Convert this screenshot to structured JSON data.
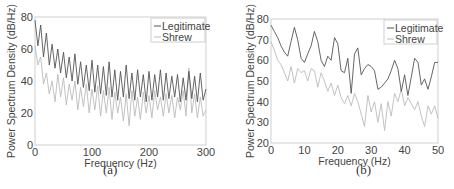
{
  "chart_data": [
    {
      "type": "line",
      "caption": "(a)",
      "title": "",
      "xlabel": "Frequency (Hz)",
      "ylabel": "Power Spectrum Density (dB/Hz)",
      "xlim": [
        0,
        300
      ],
      "ylim": [
        0,
        80
      ],
      "xticks": [
        0,
        100,
        200,
        300
      ],
      "yticks": [
        0,
        20,
        40,
        60,
        80
      ],
      "grid": false,
      "legend_position": "top-right",
      "x": [
        0,
        5,
        10,
        15,
        20,
        25,
        30,
        35,
        40,
        45,
        50,
        55,
        60,
        65,
        70,
        75,
        80,
        85,
        90,
        95,
        100,
        105,
        110,
        115,
        120,
        125,
        130,
        135,
        140,
        145,
        150,
        155,
        160,
        165,
        170,
        175,
        180,
        185,
        190,
        195,
        200,
        205,
        210,
        215,
        220,
        225,
        230,
        235,
        240,
        245,
        250,
        255,
        260,
        265,
        270,
        275,
        280,
        285,
        290,
        295,
        300
      ],
      "series": [
        {
          "name": "Legitimate",
          "color": "#555555",
          "values": [
            78,
            62,
            75,
            55,
            70,
            50,
            63,
            48,
            60,
            45,
            58,
            42,
            55,
            40,
            57,
            38,
            52,
            36,
            50,
            34,
            53,
            33,
            50,
            32,
            49,
            31,
            52,
            30,
            47,
            28,
            46,
            30,
            50,
            29,
            45,
            28,
            47,
            30,
            44,
            27,
            46,
            28,
            44,
            30,
            47,
            28,
            45,
            29,
            43,
            30,
            44,
            27,
            42,
            28,
            46,
            29,
            43,
            27,
            45,
            28,
            35
          ]
        },
        {
          "name": "Shrew",
          "color": "#bbbbbb",
          "values": [
            62,
            50,
            55,
            38,
            45,
            32,
            40,
            27,
            44,
            30,
            42,
            25,
            38,
            28,
            40,
            22,
            36,
            24,
            38,
            20,
            35,
            22,
            37,
            18,
            34,
            20,
            36,
            16,
            33,
            20,
            30,
            15,
            32,
            12,
            34,
            18,
            30,
            16,
            33,
            20,
            31,
            17,
            34,
            22,
            30,
            18,
            32,
            20,
            31,
            17,
            30,
            22,
            34,
            18,
            48,
            20,
            32,
            17,
            30,
            18,
            22
          ]
        }
      ]
    },
    {
      "type": "line",
      "caption": "(b)",
      "title": "",
      "xlabel": "Frequency (Hz)",
      "ylabel": "Power Spectrum Density (dB/Hz)",
      "xlim": [
        0,
        50
      ],
      "ylim": [
        20,
        80
      ],
      "xticks": [
        0,
        10,
        20,
        30,
        40,
        50
      ],
      "yticks": [
        20,
        30,
        40,
        50,
        60,
        70,
        80
      ],
      "grid": false,
      "legend_position": "top-right",
      "x": [
        0,
        1,
        2,
        3,
        4,
        5,
        6,
        7,
        8,
        9,
        10,
        11,
        12,
        13,
        14,
        15,
        16,
        17,
        18,
        19,
        20,
        21,
        22,
        23,
        24,
        25,
        26,
        27,
        28,
        29,
        30,
        31,
        32,
        33,
        34,
        35,
        36,
        37,
        38,
        39,
        40,
        41,
        42,
        43,
        44,
        45,
        46,
        47,
        48,
        49,
        50
      ],
      "series": [
        {
          "name": "Legitimate",
          "color": "#555555",
          "values": [
            77,
            74,
            71,
            67,
            64,
            62,
            69,
            76,
            70,
            61,
            59,
            63,
            67,
            74,
            69,
            60,
            57,
            62,
            60,
            71,
            68,
            55,
            54,
            61,
            44,
            63,
            66,
            53,
            56,
            58,
            57,
            55,
            46,
            47,
            49,
            51,
            55,
            60,
            56,
            45,
            53,
            43,
            52,
            61,
            59,
            48,
            51,
            46,
            52,
            59,
            59
          ]
        },
        {
          "name": "Shrew",
          "color": "#bbbbbb",
          "values": [
            69,
            65,
            60,
            58,
            54,
            50,
            57,
            49,
            56,
            54,
            55,
            50,
            56,
            55,
            47,
            54,
            50,
            45,
            49,
            43,
            48,
            42,
            39,
            43,
            38,
            44,
            40,
            34,
            28,
            43,
            35,
            40,
            30,
            39,
            26,
            40,
            33,
            44,
            40,
            46,
            38,
            42,
            39,
            36,
            40,
            33,
            28,
            38,
            34,
            38,
            32
          ]
        }
      ]
    }
  ]
}
